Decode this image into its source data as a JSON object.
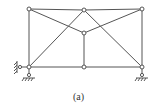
{
  "diagram": {
    "type": "truss",
    "caption": "(a)",
    "colors": {
      "stroke": "#555555",
      "node_fill": "#ffffff"
    },
    "nodes": [
      {
        "id": "A",
        "x": 29,
        "y": 67
      },
      {
        "id": "B",
        "x": 84,
        "y": 67
      },
      {
        "id": "C",
        "x": 142,
        "y": 67
      },
      {
        "id": "D",
        "x": 29,
        "y": 9
      },
      {
        "id": "E",
        "x": 84,
        "y": 10
      },
      {
        "id": "F",
        "x": 142,
        "y": 9
      },
      {
        "id": "G",
        "x": 84,
        "y": 33
      }
    ],
    "members": [
      [
        "A",
        "B"
      ],
      [
        "B",
        "C"
      ],
      [
        "D",
        "E"
      ],
      [
        "E",
        "F"
      ],
      [
        "A",
        "D"
      ],
      [
        "C",
        "F"
      ],
      [
        "B",
        "G"
      ],
      [
        "D",
        "G"
      ],
      [
        "F",
        "G"
      ],
      [
        "A",
        "E"
      ],
      [
        "E",
        "C"
      ]
    ],
    "supports": [
      {
        "node": "A",
        "kind": "pin-vertical"
      },
      {
        "node": "A",
        "kind": "horizontal-link-to-wall"
      },
      {
        "node": "C",
        "kind": "pin-vertical"
      }
    ]
  }
}
